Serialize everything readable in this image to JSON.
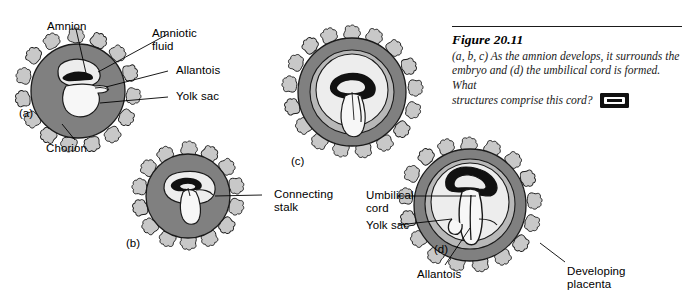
{
  "figure": {
    "title": "Figure 20.11",
    "caption_line1": "(a, b, c) As the amnion develops, it surrounds the",
    "caption_line2": "embryo and (d) the umbilical cord is formed. What",
    "caption_line3": "structures comprise this cord?",
    "media_icon": "videocassette-icon"
  },
  "panels": {
    "a": {
      "tag": "(a)"
    },
    "b": {
      "tag": "(b)"
    },
    "c": {
      "tag": "(c)"
    },
    "d": {
      "tag": "(d)"
    }
  },
  "labels": {
    "amnion": "Amnion",
    "amniotic_fluid_l1": "Amniotic",
    "amniotic_fluid_l2": "fluid",
    "allantois_a": "Allantois",
    "yolk_sac_a": "Yolk sac",
    "chorion": "Chorion",
    "connecting_stalk_l1": "Connecting",
    "connecting_stalk_l2": "stalk",
    "umbilical_cord_l1": "Umbilical",
    "umbilical_cord_l2": "cord",
    "yolk_sac_d": "Yolk sac",
    "allantois_d": "Allantois",
    "developing_placenta_l1": "Developing",
    "developing_placenta_l2": "placenta"
  },
  "colors": {
    "chorion_gray": "#808080",
    "amnion_cavity_light": "#d9d9d9",
    "yolk_sac_white": "#f2f2f2",
    "villi_gray": "#c8c8c8",
    "outline": "#1a1a1a",
    "embryo_black": "#111111",
    "caption_rule": "#1a1a1a"
  }
}
